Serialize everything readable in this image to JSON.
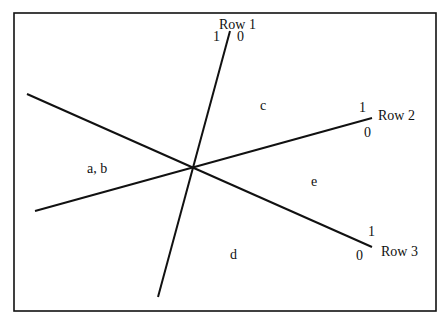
{
  "diagram": {
    "rows": [
      {
        "name": "Row 1",
        "side_one": "1",
        "side_zero": "0"
      },
      {
        "name": "Row 2",
        "side_one": "1",
        "side_zero": "0"
      },
      {
        "name": "Row 3",
        "side_one": "1",
        "side_zero": "0"
      }
    ],
    "regions": [
      "c",
      "a, b",
      "e",
      "d"
    ],
    "colors": {
      "line": "#111111",
      "background": "#ffffff"
    }
  }
}
